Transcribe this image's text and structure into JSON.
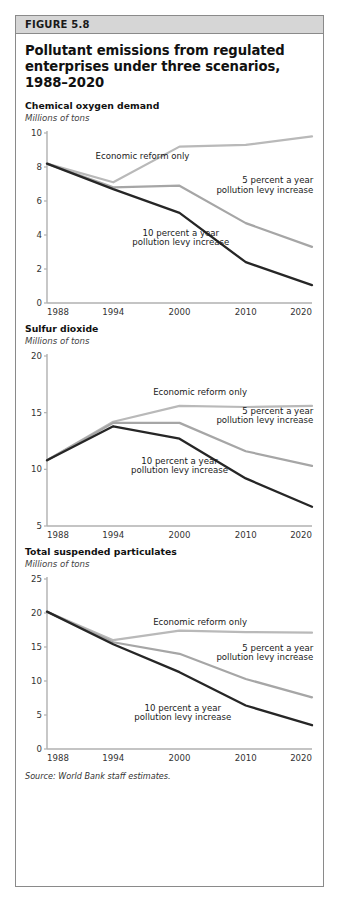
{
  "figure": {
    "number_label": "FIGURE 5.8",
    "title": "Pollutant emissions from regulated enterprises under three scenarios, 1988–2020",
    "source": "Source: World Bank staff estimates."
  },
  "colors": {
    "economic_reform": "#b9b9b9",
    "five_percent": "#a6a6a6",
    "ten_percent": "#262626",
    "axis": "#b0b0b0",
    "header_band": "#d6d6d6",
    "border": "#8a8a8a",
    "text": "#111111"
  },
  "series_labels": {
    "economic_reform": "Economic reform only",
    "five_percent_line1": "5 percent a year",
    "five_percent_line2": "pollution levy increase",
    "ten_percent_line1": "10 percent a year",
    "ten_percent_line2": "pollution levy increase"
  },
  "chart_data": [
    {
      "type": "line",
      "title": "Chemical oxygen demand",
      "ylabel": "Millions of tons",
      "xlabel": "",
      "categories": [
        "1988",
        "1994",
        "2000",
        "2010",
        "2020"
      ],
      "x": [
        1988,
        1994,
        2000,
        2010,
        2020
      ],
      "ylim": [
        0,
        10
      ],
      "yticks": [
        0,
        2,
        4,
        6,
        8,
        10
      ],
      "grid": false,
      "legend": "inline-annotations",
      "series": [
        {
          "name": "Economic reform only",
          "values": [
            8.2,
            7.1,
            9.2,
            9.3,
            9.8
          ]
        },
        {
          "name": "5 percent a year pollution levy increase",
          "values": [
            8.2,
            6.8,
            6.9,
            4.7,
            3.3
          ]
        },
        {
          "name": "10 percent a year pollution levy increase",
          "values": [
            8.2,
            6.7,
            5.3,
            2.4,
            1.05
          ]
        }
      ]
    },
    {
      "type": "line",
      "title": "Sulfur dioxide",
      "ylabel": "Millions of tons",
      "xlabel": "",
      "categories": [
        "1988",
        "1994",
        "2000",
        "2010",
        "2020"
      ],
      "x": [
        1988,
        1994,
        2000,
        2010,
        2020
      ],
      "ylim": [
        5,
        20
      ],
      "yticks": [
        5,
        10,
        15,
        20
      ],
      "grid": false,
      "legend": "inline-annotations",
      "series": [
        {
          "name": "Economic reform only",
          "values": [
            10.8,
            14.2,
            15.6,
            15.5,
            15.6
          ]
        },
        {
          "name": "5 percent a year pollution levy increase",
          "values": [
            10.8,
            14.1,
            14.1,
            11.6,
            10.3
          ]
        },
        {
          "name": "10 percent a year pollution levy increase",
          "values": [
            10.8,
            13.8,
            12.7,
            9.2,
            6.7
          ]
        }
      ]
    },
    {
      "type": "line",
      "title": "Total suspended particulates",
      "ylabel": "Millions of tons",
      "xlabel": "",
      "categories": [
        "1988",
        "1994",
        "2000",
        "2010",
        "2020"
      ],
      "x": [
        1988,
        1994,
        2000,
        2010,
        2020
      ],
      "ylim": [
        0,
        25
      ],
      "yticks": [
        0,
        5,
        10,
        15,
        20,
        25
      ],
      "grid": false,
      "legend": "inline-annotations",
      "series": [
        {
          "name": "Economic reform only",
          "values": [
            20.2,
            16.0,
            17.4,
            17.2,
            17.1
          ]
        },
        {
          "name": "5 percent a year pollution levy increase",
          "values": [
            20.2,
            15.7,
            14.0,
            10.3,
            7.6
          ]
        },
        {
          "name": "10 percent a year pollution levy increase",
          "values": [
            20.2,
            15.4,
            11.3,
            6.4,
            3.5
          ]
        }
      ]
    }
  ]
}
